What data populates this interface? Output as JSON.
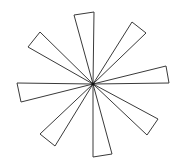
{
  "diagram": {
    "type": "radial-triangle-star",
    "background": "#ffffff",
    "stroke_color": "#3a3a3a",
    "center": [
      93,
      84
    ],
    "triangle_count": 8,
    "triangles": [
      {
        "id": "top",
        "a": [
          74,
          15
        ],
        "b": [
          94,
          12
        ]
      },
      {
        "id": "top-right",
        "a": [
          132,
          22
        ],
        "b": [
          146,
          33
        ]
      },
      {
        "id": "right-upper",
        "a": [
          166,
          66
        ],
        "b": [
          169,
          83
        ]
      },
      {
        "id": "right-lower",
        "a": [
          158,
          119
        ],
        "b": [
          147,
          135
        ]
      },
      {
        "id": "bottom-right",
        "a": [
          112,
          154
        ],
        "b": [
          93,
          157
        ]
      },
      {
        "id": "bottom-left",
        "a": [
          55,
          146
        ],
        "b": [
          40,
          134
        ]
      },
      {
        "id": "left-lower",
        "a": [
          21,
          102
        ],
        "b": [
          17,
          83
        ]
      },
      {
        "id": "left-upper",
        "a": [
          28,
          47
        ],
        "b": [
          40,
          32
        ]
      }
    ]
  }
}
